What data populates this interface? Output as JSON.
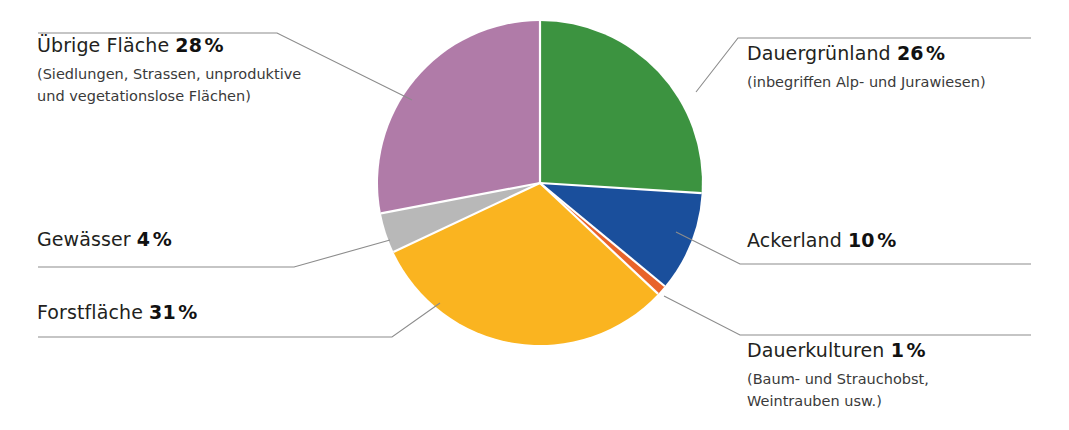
{
  "chart_data": {
    "type": "pie",
    "title": "",
    "unit": "%",
    "total": 100,
    "categories": [
      "Dauergrünland",
      "Ackerland",
      "Dauerkulturen",
      "Forstfläche",
      "Gewässer",
      "Übrige Fläche"
    ],
    "values": [
      26,
      10,
      1,
      31,
      4,
      28
    ],
    "colors": [
      "#3c9340",
      "#1a4f9c",
      "#e8632a",
      "#fab420",
      "#b8b8b8",
      "#b07ba8"
    ],
    "start_angle_deg": 0,
    "direction": "clockwise",
    "legend": "callout-labels",
    "grid": false,
    "slices": [
      {
        "name": "Dauergrünland",
        "value": 26,
        "value_label": "26",
        "color": "#3c9340",
        "note": "(inbegriffen Alp- und Jurawiesen)"
      },
      {
        "name": "Ackerland",
        "value": 10,
        "value_label": "10",
        "color": "#1a4f9c",
        "note": ""
      },
      {
        "name": "Dauerkulturen",
        "value": 1,
        "value_label": "1",
        "color": "#e8632a",
        "note": "(Baum- und Strauchobst, Weintrauben usw.)"
      },
      {
        "name": "Forstfläche",
        "value": 31,
        "value_label": "31",
        "color": "#fab420",
        "note": ""
      },
      {
        "name": "Gewässer",
        "value": 4,
        "value_label": "4",
        "color": "#b8b8b8",
        "note": ""
      },
      {
        "name": "Übrige Fläche",
        "value": 28,
        "value_label": "28",
        "color": "#b07ba8",
        "note": "(Siedlungen, Strassen, unproduktive und vegetationslose Flächen)"
      }
    ]
  },
  "labels": {
    "uebrige": {
      "title": "Übrige Fläche",
      "percent": "28",
      "suffix": "%",
      "sub_line1": "(Siedlungen, Strassen, unproduktive",
      "sub_line2": "und vegetationslose Flächen)"
    },
    "gewaesser": {
      "title": "Gewässer",
      "percent": "4",
      "suffix": "%"
    },
    "forst": {
      "title": "Forstfläche",
      "percent": "31",
      "suffix": "%"
    },
    "dauergruenland": {
      "title": "Dauergrünland",
      "percent": "26",
      "suffix": "%",
      "sub_line1": "(inbegriffen Alp- und Jurawiesen)"
    },
    "ackerland": {
      "title": "Ackerland",
      "percent": "10",
      "suffix": "%"
    },
    "dauerkulturen": {
      "title": "Dauerkulturen",
      "percent": "1",
      "suffix": "%",
      "sub_line1": "(Baum- und Strauchobst,",
      "sub_line2": "Weintrauben usw.)"
    }
  },
  "style": {
    "leader_line_color": "#8c8c8c",
    "background": "#ffffff"
  }
}
